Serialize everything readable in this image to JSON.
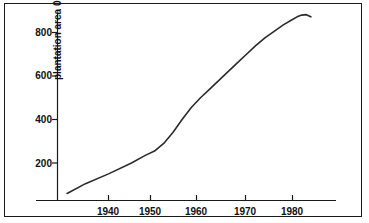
{
  "figure": {
    "background_color": "#ffffff",
    "border_color": "#1a1a1a",
    "line_color": "#2b2b2b",
    "axis_color": "#1a1a1a",
    "text_color": "#111111"
  },
  "axis_title_arrow_glyph": "▲",
  "chart_data": {
    "type": "line",
    "title": "",
    "subtitle": "",
    "xlabel": "",
    "ylabel": "plantation area 000's ha",
    "xlim": [
      1931,
      1987
    ],
    "ylim": [
      0,
      920
    ],
    "grid": false,
    "legend": "none",
    "xticks": [
      1940,
      1950,
      1960,
      1970,
      1980
    ],
    "xtick_labels": [
      "1940",
      "1950",
      "1960",
      "1970",
      "1980"
    ],
    "yticks": [
      200,
      400,
      600,
      800
    ],
    "ytick_labels": [
      "200",
      "400",
      "600",
      "800"
    ],
    "series": [
      {
        "name": "plantation area",
        "x": [
          1931,
          1935,
          1940,
          1945,
          1948,
          1950,
          1952,
          1954,
          1956,
          1958,
          1960,
          1962,
          1964,
          1966,
          1968,
          1970,
          1972,
          1974,
          1976,
          1978,
          1980,
          1981,
          1982,
          1983,
          1984
        ],
        "values": [
          60,
          105,
          150,
          200,
          235,
          255,
          290,
          340,
          400,
          455,
          500,
          540,
          580,
          620,
          660,
          700,
          740,
          775,
          805,
          835,
          860,
          872,
          880,
          882,
          872
        ]
      }
    ],
    "annotations": []
  },
  "ylabels": [
    {
      "value": "800"
    },
    {
      "value": "600"
    },
    {
      "value": "400"
    },
    {
      "value": "200"
    }
  ],
  "xlabels": [
    {
      "value": "1940"
    },
    {
      "value": "1950"
    },
    {
      "value": "1960"
    },
    {
      "value": "1970"
    },
    {
      "value": "1980"
    }
  ]
}
